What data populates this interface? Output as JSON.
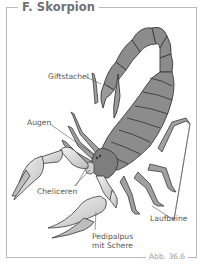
{
  "figure": {
    "title": "F. Skorpion",
    "caption": "Abb. 36.6"
  },
  "labels": {
    "giftstachel": "Giftstachel",
    "augen": "Augen",
    "cheliceren": "Cheliceren",
    "laufbeine": "Laufbeine",
    "pedipalpus_line1": "Pedipalpus",
    "pedipalpus_line2": "mit Schere"
  },
  "colors": {
    "body": "#8c8c8c",
    "outline": "#3a3a3a",
    "claw": "#d9d9d9",
    "frame": "#b9b9b9",
    "text": "#555555"
  }
}
